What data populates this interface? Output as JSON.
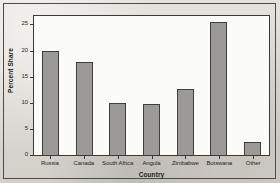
{
  "chart_data": {
    "type": "bar",
    "title": "",
    "subtitle": "",
    "xlabel": "Country",
    "ylabel": "Percent Share",
    "categories": [
      "Russia",
      "Canada",
      "South Africa",
      "Angola",
      "Zimbabwe",
      "Botswana",
      "Other"
    ],
    "values": [
      20.0,
      17.9,
      10.0,
      9.8,
      12.7,
      25.5,
      2.5
    ],
    "ylim": [
      0,
      27
    ],
    "yticks": [
      0,
      5,
      10,
      15,
      20,
      25
    ],
    "ytick_labels": [
      "0",
      "5",
      "10",
      "15",
      "20",
      "25"
    ],
    "grid": false,
    "legend": false,
    "legend_position": "none",
    "bar_color": "#9c9a96",
    "bar_edge_color": "#403f3c",
    "plot_background": "#fbfbf8",
    "figure_background": "#dedcd6",
    "frame_color": "#4a4a46"
  }
}
